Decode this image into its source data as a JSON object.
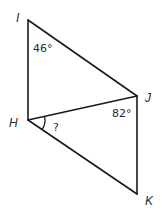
{
  "diagram": {
    "type": "geometry",
    "vertices": [
      {
        "name": "I",
        "x": 28,
        "y": 20,
        "label_x": 16,
        "label_y": 22
      },
      {
        "name": "H",
        "x": 28,
        "y": 120,
        "label_x": 9,
        "label_y": 127
      },
      {
        "name": "J",
        "x": 137,
        "y": 96,
        "label_x": 145,
        "label_y": 102
      },
      {
        "name": "K",
        "x": 137,
        "y": 194,
        "label_x": 145,
        "label_y": 205
      }
    ],
    "labels": {
      "I": "I",
      "H": "H",
      "J": "J",
      "K": "K"
    },
    "segments": [
      {
        "from": "I",
        "to": "H"
      },
      {
        "from": "I",
        "to": "J"
      },
      {
        "from": "H",
        "to": "J"
      },
      {
        "from": "H",
        "to": "K"
      },
      {
        "from": "J",
        "to": "K"
      }
    ],
    "angles": {
      "angle_I": {
        "vertex": "I",
        "value": "46°",
        "x": 33,
        "y": 52
      },
      "angle_J": {
        "vertex": "J",
        "value": "82°",
        "x": 112,
        "y": 117
      },
      "angle_H": {
        "vertex": "H",
        "value": "?",
        "x": 53,
        "y": 131,
        "marked_with_arc": true
      }
    },
    "colors": {
      "stroke": "#1a1a1a",
      "text": "#2a2a2a",
      "background": "#ffffff"
    }
  }
}
